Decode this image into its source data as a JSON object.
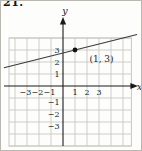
{
  "figure": {
    "problem_number": "21."
  },
  "chart_data": {
    "type": "line",
    "title": "",
    "xlabel": "x",
    "ylabel": "y",
    "x_ticks": [
      -3,
      -2,
      -1,
      1,
      2,
      3
    ],
    "y_ticks": [
      3,
      2,
      1,
      -1,
      -2,
      -3
    ],
    "xlim": [
      -4.5,
      5.7
    ],
    "ylim": [
      -5,
      4
    ],
    "grid": true,
    "series": [
      {
        "name": "line-through-point",
        "slope": 0.25,
        "intercept": 2.75,
        "equation_estimate": "y = 0.25x + 2.75",
        "x_draw_range": [
          -4.92,
          6.17
        ]
      }
    ],
    "points": [
      {
        "x": 1,
        "y": 3,
        "label": "(1, 3)"
      }
    ],
    "colors": {
      "paper": "#fdfdfb",
      "frame": "#b9b9b2",
      "grid": "#c7c7c2",
      "axis": "#1a1a1a",
      "line": "#3d3d3d",
      "point": "#111111",
      "text": "#1a1a1a"
    }
  }
}
